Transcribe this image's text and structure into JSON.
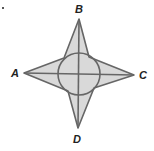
{
  "diagram": {
    "type": "geometry",
    "labels": {
      "top": "B",
      "left": "A",
      "right": "C",
      "bottom": "D"
    },
    "points": {
      "A": [
        24,
        73
      ],
      "B": [
        79,
        19
      ],
      "C": [
        134,
        75
      ],
      "D": [
        78,
        128
      ],
      "center": [
        79,
        74
      ]
    },
    "circle_radius": 21,
    "fill_color": "#d9d9d9",
    "stroke_color": "#666666"
  }
}
